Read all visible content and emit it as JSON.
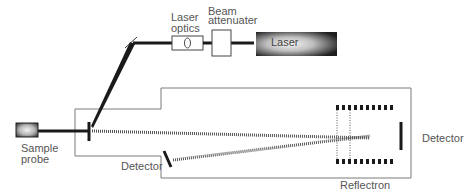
{
  "diagram": {
    "labels": {
      "laser_optics_line1": "Laser",
      "laser_optics_line2": "optics",
      "beam_attenuater_line1": "Beam",
      "beam_attenuater_line2": "attenuater",
      "laser": "Laser",
      "sample_probe_line1": "Sample",
      "sample_probe_line2": "probe",
      "detector_linear": "Detector",
      "detector_reflectron": "Detector",
      "reflectron": "Reflectron"
    },
    "components": [
      {
        "id": "laser",
        "label": "Laser"
      },
      {
        "id": "beam-attenuater",
        "label": "Beam attenuater"
      },
      {
        "id": "laser-optics",
        "label": "Laser optics"
      },
      {
        "id": "mirror",
        "label": ""
      },
      {
        "id": "sample-probe",
        "label": "Sample probe"
      },
      {
        "id": "flight-tube",
        "label": ""
      },
      {
        "id": "reflectron",
        "label": "Reflectron"
      },
      {
        "id": "detector-reflectron",
        "label": "Detector"
      },
      {
        "id": "detector-linear",
        "label": "Detector"
      }
    ],
    "colors": {
      "line": "#1a1a1a",
      "outline": "#777777",
      "text": "#555555",
      "laser_dark": "#1e1e1e",
      "laser_light": "#f4f4f4"
    }
  }
}
